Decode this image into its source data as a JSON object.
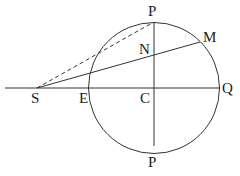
{
  "diagram": {
    "labels": {
      "P_top": "P",
      "M": "M",
      "N": "N",
      "S": "S",
      "E": "E",
      "C": "C",
      "Q": "Q",
      "P_bottom": "P"
    },
    "colors": {
      "stroke": "#333333",
      "background": "#ffffff"
    }
  }
}
